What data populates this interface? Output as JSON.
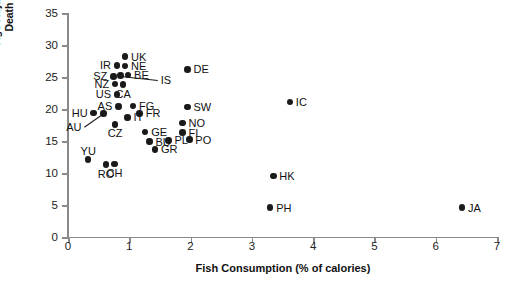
{
  "chart_data": {
    "type": "scatter",
    "title": "",
    "xlabel": "Fish Consumption (% of calories)",
    "ylabel": "Age-Adjusted Breast Cancer\nDeath Rate per 100,000",
    "xlim": [
      0,
      7
    ],
    "ylim": [
      0,
      35
    ],
    "xticks": [
      0,
      1,
      2,
      3,
      4,
      5,
      6,
      7
    ],
    "yticks": [
      0,
      5,
      10,
      15,
      20,
      25,
      30,
      35
    ],
    "grid": false,
    "legend": null,
    "marker_color": "#1a1a1a",
    "axis_color": "#8a8a8a",
    "points": [
      {
        "label": "UK",
        "x": 0.93,
        "y": 28.2,
        "label_pos": "right"
      },
      {
        "label": "IR",
        "x": 0.8,
        "y": 26.8,
        "label_pos": "left"
      },
      {
        "label": "NE",
        "x": 0.93,
        "y": 26.7,
        "label_pos": "right"
      },
      {
        "label": "BE",
        "x": 0.98,
        "y": 25.3,
        "label_pos": "right"
      },
      {
        "label": "SZ",
        "x": 0.74,
        "y": 25.1,
        "label_pos": "left"
      },
      {
        "label": "IS",
        "x": 0.86,
        "y": 25.2,
        "label_pos": "leader"
      },
      {
        "label": "NZ",
        "x": 0.77,
        "y": 23.9,
        "label_pos": "left"
      },
      {
        "label": "CA",
        "x": 0.9,
        "y": 23.8,
        "label_pos": "below"
      },
      {
        "label": "US",
        "x": 0.8,
        "y": 22.3,
        "label_pos": "left"
      },
      {
        "label": "AS",
        "x": 0.82,
        "y": 20.4,
        "label_pos": "left"
      },
      {
        "label": "FG",
        "x": 1.06,
        "y": 20.5,
        "label_pos": "right"
      },
      {
        "label": "FR",
        "x": 1.17,
        "y": 19.3,
        "label_pos": "right"
      },
      {
        "label": "HU",
        "x": 0.42,
        "y": 19.4,
        "label_pos": "left"
      },
      {
        "label": "AU",
        "x": 0.58,
        "y": 19.3,
        "label_pos": "leader"
      },
      {
        "label": "IT",
        "x": 0.97,
        "y": 18.7,
        "label_pos": "right"
      },
      {
        "label": "CZ",
        "x": 0.77,
        "y": 17.6,
        "label_pos": "below"
      },
      {
        "label": "GE",
        "x": 1.26,
        "y": 16.4,
        "label_pos": "right"
      },
      {
        "label": "NO",
        "x": 1.87,
        "y": 17.8,
        "label_pos": "right"
      },
      {
        "label": "FI",
        "x": 1.87,
        "y": 16.3,
        "label_pos": "right"
      },
      {
        "label": "PO",
        "x": 1.98,
        "y": 15.2,
        "label_pos": "right"
      },
      {
        "label": "PL",
        "x": 1.64,
        "y": 15.1,
        "label_pos": "right"
      },
      {
        "label": "BU",
        "x": 1.33,
        "y": 14.9,
        "label_pos": "right"
      },
      {
        "label": "GR",
        "x": 1.42,
        "y": 13.7,
        "label_pos": "right"
      },
      {
        "label": "YU",
        "x": 0.33,
        "y": 12.1,
        "label_pos": "above"
      },
      {
        "label": "RO",
        "x": 0.62,
        "y": 11.3,
        "label_pos": "below"
      },
      {
        "label": "CH",
        "x": 0.76,
        "y": 11.4,
        "label_pos": "below"
      },
      {
        "label": "DE",
        "x": 1.95,
        "y": 26.2,
        "label_pos": "right"
      },
      {
        "label": "SW",
        "x": 1.95,
        "y": 20.3,
        "label_pos": "right"
      },
      {
        "label": "IC",
        "x": 3.62,
        "y": 21.1,
        "label_pos": "right"
      },
      {
        "label": "HK",
        "x": 3.35,
        "y": 9.5,
        "label_pos": "right"
      },
      {
        "label": "PH",
        "x": 3.3,
        "y": 4.6,
        "label_pos": "right"
      },
      {
        "label": "JA",
        "x": 6.43,
        "y": 4.6,
        "label_pos": "right"
      }
    ]
  },
  "axis_titles": {
    "x": "Fish Consumption (% of calories)",
    "y_line1": "Age-Adjusted Breast Cancer",
    "y_line2": "Death Rate per 100,000"
  }
}
